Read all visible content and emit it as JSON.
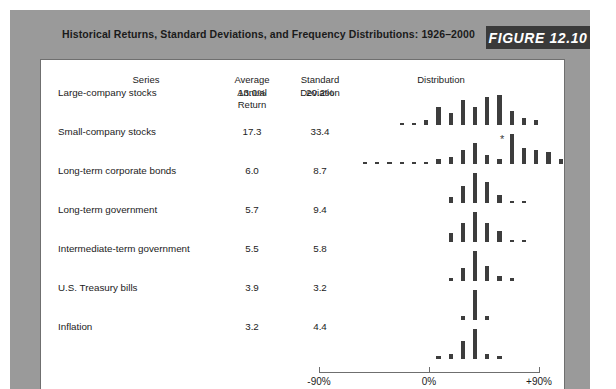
{
  "figure": {
    "caption": "Historical Returns, Standard Deviations, and Frequency Distributions: 1926–2000",
    "badge_label": "FIGURE 12.10",
    "badge_color": "#3a3a3a",
    "backing_color": "#9a9a9a",
    "bar_color": "#3d3d3d"
  },
  "table": {
    "headers": {
      "series": "Series",
      "average_annual_return": "Average\nAnnual\nReturn",
      "standard_deviation": "Standard\nDeviation",
      "distribution": "Distribution"
    },
    "rows": [
      {
        "series": "Large-company stocks",
        "average_annual_return": "13.0%",
        "standard_deviation": "20.2%"
      },
      {
        "series": "Small-company stocks",
        "average_annual_return": "17.3",
        "standard_deviation": "33.4"
      },
      {
        "series": "Long-term corporate bonds",
        "average_annual_return": "6.0",
        "standard_deviation": "8.7"
      },
      {
        "series": "Long-term government",
        "average_annual_return": "5.7",
        "standard_deviation": "9.4"
      },
      {
        "series": "Intermediate-term government",
        "average_annual_return": "5.5",
        "standard_deviation": "5.8"
      },
      {
        "series": "U.S. Treasury bills",
        "average_annual_return": "3.9",
        "standard_deviation": "3.2"
      },
      {
        "series": "Inflation",
        "average_annual_return": "3.2",
        "standard_deviation": "4.4"
      }
    ]
  },
  "axis": {
    "labels": [
      "-90%",
      "0%",
      "+90%"
    ],
    "min": -90,
    "max": 90,
    "zero_label": "0%"
  },
  "chart_data": {
    "type": "bar",
    "title": "Historical Returns, Standard Deviations, and Frequency Distributions: 1926–2000",
    "xlabel": "Annual return (%)",
    "ylabel": "Frequency (number of years)",
    "xlim": [
      -90,
      90
    ],
    "grid": false,
    "legend": "none",
    "bin_width": 10,
    "bin_centers": [
      -85,
      -75,
      -65,
      -55,
      -45,
      -35,
      -25,
      -15,
      -5,
      5,
      15,
      25,
      35,
      45,
      55,
      65,
      75,
      85
    ],
    "annotations": [
      {
        "series": "Small-company stocks",
        "symbol": "*",
        "bin_center": 145,
        "note": "off-scale observation"
      }
    ],
    "series": [
      {
        "name": "Large-company stocks",
        "average_annual_return": 13.0,
        "standard_deviation": 20.2,
        "bins": [
          -55,
          -45,
          -35,
          -25,
          -15,
          -5,
          5,
          15,
          25,
          35,
          45,
          55
        ],
        "values": [
          1,
          1,
          2,
          8,
          5,
          11,
          8,
          12,
          13,
          6,
          3,
          2
        ]
      },
      {
        "name": "Small-company stocks",
        "average_annual_return": 17.3,
        "standard_deviation": 33.4,
        "bins": [
          -85,
          -75,
          -65,
          -55,
          -45,
          -35,
          -25,
          -15,
          -5,
          5,
          15,
          25,
          35,
          45,
          55,
          65,
          75,
          85,
          105,
          125,
          145
        ],
        "values": [
          1,
          1,
          1,
          1,
          1,
          1,
          2,
          3,
          6,
          9,
          4,
          2,
          13,
          7,
          6,
          5,
          2,
          3,
          1,
          1,
          1
        ]
      },
      {
        "name": "Long-term corporate bonds",
        "average_annual_return": 6.0,
        "standard_deviation": 8.7,
        "bins": [
          -15,
          -5,
          5,
          15,
          25,
          35,
          45
        ],
        "values": [
          3,
          9,
          16,
          11,
          4,
          1,
          1
        ]
      },
      {
        "name": "Long-term government",
        "average_annual_return": 5.7,
        "standard_deviation": 9.4,
        "bins": [
          -15,
          -5,
          5,
          15,
          25,
          35,
          45
        ],
        "values": [
          4,
          9,
          14,
          9,
          5,
          1,
          1
        ]
      },
      {
        "name": "Intermediate-term government",
        "average_annual_return": 5.5,
        "standard_deviation": 5.8,
        "bins": [
          -15,
          -5,
          5,
          15,
          25,
          35
        ],
        "values": [
          1,
          5,
          12,
          6,
          2,
          1
        ]
      },
      {
        "name": "U.S. Treasury bills",
        "average_annual_return": 3.9,
        "standard_deviation": 3.2,
        "bins": [
          -5,
          5,
          15
        ],
        "values": [
          2,
          14,
          2
        ]
      },
      {
        "name": "Inflation",
        "average_annual_return": 3.2,
        "standard_deviation": 4.4,
        "bins": [
          -25,
          -15,
          -5,
          5,
          15,
          25
        ],
        "values": [
          1,
          2,
          7,
          12,
          2,
          1
        ]
      }
    ]
  }
}
